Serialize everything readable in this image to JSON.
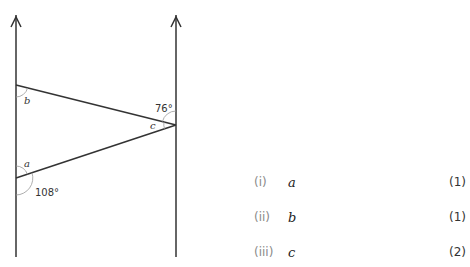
{
  "diagram": {
    "parallel_lines": [
      {
        "x": 16,
        "y_top": 15,
        "y_bottom": 257
      },
      {
        "x": 176,
        "y_top": 15,
        "y_bottom": 257
      }
    ],
    "vertices": {
      "top_left": {
        "x": 16,
        "y": 85
      },
      "bottom_left": {
        "x": 16,
        "y": 178
      },
      "apex_right": {
        "x": 176,
        "y": 125
      }
    },
    "angle_labels": {
      "b": "b",
      "a": "a",
      "c": "c",
      "given_top_right": "76°",
      "given_bottom_left": "108°"
    },
    "colors": {
      "line": "#333333",
      "arc": "#999999",
      "text": "#333333"
    }
  },
  "questions": [
    {
      "num": "(i)",
      "var": "a",
      "marks": "(1)"
    },
    {
      "num": "(ii)",
      "var": "b",
      "marks": "(1)"
    },
    {
      "num": "(iii)",
      "var": "c",
      "marks": "(2)"
    }
  ]
}
